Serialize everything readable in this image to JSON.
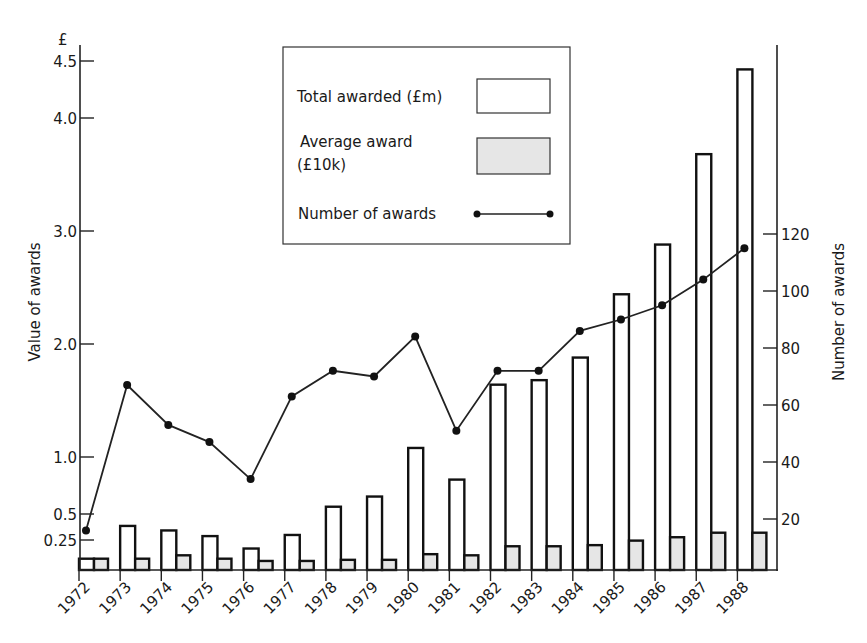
{
  "chart_data": {
    "type": "bar",
    "title": "",
    "xlabel": "",
    "ylabel": "Value of awards",
    "ylabel_unit": "£",
    "y2label": "Number of awards",
    "categories": [
      "1972",
      "1973",
      "1974",
      "1975",
      "1976",
      "1977",
      "1978",
      "1979",
      "1980",
      "1981",
      "1982",
      "1983",
      "1984",
      "1985",
      "1986",
      "1987",
      "1988"
    ],
    "series": [
      {
        "name": "Total awarded (£m)",
        "type": "bar",
        "axis": "left",
        "fill": "#ffffff",
        "values": [
          0.1,
          0.39,
          0.35,
          0.3,
          0.19,
          0.31,
          0.56,
          0.65,
          1.08,
          0.8,
          1.64,
          1.68,
          1.88,
          2.44,
          2.88,
          3.68,
          4.43
        ]
      },
      {
        "name": "Average award (£10k)",
        "type": "bar",
        "axis": "left",
        "fill": "#e6e6e6",
        "values": [
          0.1,
          0.1,
          0.13,
          0.1,
          0.08,
          0.08,
          0.09,
          0.09,
          0.14,
          0.13,
          0.21,
          0.21,
          0.22,
          0.26,
          0.29,
          0.33,
          0.33
        ]
      },
      {
        "name": "Number of awards",
        "type": "line",
        "axis": "right",
        "marker": "circle",
        "values": [
          16,
          67,
          53,
          47,
          34,
          63,
          72,
          70,
          84,
          51,
          72,
          72,
          86,
          90,
          95,
          104,
          115
        ]
      }
    ],
    "left_axis": {
      "ticks": [
        {
          "value": 0.25,
          "label": "0.25"
        },
        {
          "value": 0.5,
          "label": "0.5"
        },
        {
          "value": 1.0,
          "label": "1.0"
        },
        {
          "value": 2.0,
          "label": "2.0"
        },
        {
          "value": 3.0,
          "label": "3.0"
        },
        {
          "value": 4.0,
          "label": "4.0"
        },
        {
          "value": 4.5,
          "label": "4.5"
        }
      ],
      "ylim": [
        0,
        4.6
      ]
    },
    "right_axis": {
      "ticks": [
        {
          "value": 20,
          "label": "20"
        },
        {
          "value": 40,
          "label": "40"
        },
        {
          "value": 60,
          "label": "60"
        },
        {
          "value": 80,
          "label": "80"
        },
        {
          "value": 100,
          "label": "100"
        },
        {
          "value": 120,
          "label": "120"
        }
      ],
      "ylim": [
        0,
        185
      ]
    },
    "grid": false,
    "legend": {
      "position": "top-center-boxed",
      "entries": [
        {
          "label": "Total awarded (£m)",
          "symbol": "open-box"
        },
        {
          "label_lines": [
            "Average award",
            "(£10k)"
          ],
          "symbol": "shaded-box"
        },
        {
          "label": "Number of awards",
          "symbol": "line-with-dots"
        }
      ]
    }
  }
}
